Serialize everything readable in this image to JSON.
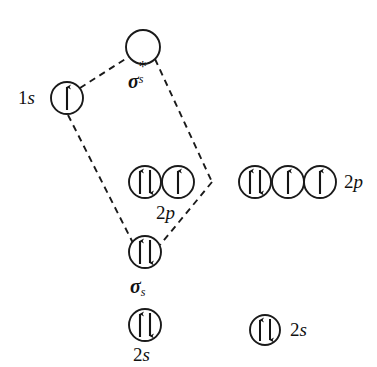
{
  "diagram": {
    "kind": "molecular-orbital-correlation-diagram",
    "background_color": "#ffffff",
    "stroke_color": "#1a1a1a",
    "text_color": "#111111",
    "width": 377,
    "height": 367
  },
  "labels": {
    "one_s": "1s",
    "sigma_s_star_symbol": "σ",
    "sigma_s_star_sub": "s",
    "sigma_s_star_sup": "*",
    "sigma_s_symbol": "σ",
    "sigma_s_sub": "s",
    "two_p_center": "2p",
    "two_p_right": "2p",
    "two_s_center": "2s",
    "two_s_right": "2s"
  },
  "orbitals": [
    {
      "id": "sigma-s-star",
      "label": "sigma-s-antibonding",
      "cx": 143,
      "cy": 47,
      "r": 17,
      "electrons": "none",
      "occupancy": 0
    },
    {
      "id": "atom-left-1s",
      "label": "1s",
      "cx": 67,
      "cy": 98,
      "r": 16,
      "electrons": "single-up",
      "occupancy": 1
    },
    {
      "id": "center-2p-a",
      "label": "2p",
      "cx": 145,
      "cy": 182,
      "r": 16,
      "electrons": "paired",
      "occupancy": 2
    },
    {
      "id": "center-2p-b",
      "label": "2p",
      "cx": 178,
      "cy": 182,
      "r": 16,
      "electrons": "single-up",
      "occupancy": 1
    },
    {
      "id": "right-2p-a",
      "label": "2p",
      "cx": 255,
      "cy": 182,
      "r": 16,
      "electrons": "paired",
      "occupancy": 2
    },
    {
      "id": "right-2p-b",
      "label": "2p",
      "cx": 288,
      "cy": 182,
      "r": 16,
      "electrons": "single-up",
      "occupancy": 1
    },
    {
      "id": "right-2p-c",
      "label": "2p",
      "cx": 320,
      "cy": 182,
      "r": 16,
      "electrons": "single-up",
      "occupancy": 1
    },
    {
      "id": "sigma-s",
      "label": "sigma-s-bonding",
      "cx": 145,
      "cy": 252,
      "r": 16,
      "electrons": "paired",
      "occupancy": 2
    },
    {
      "id": "center-2s",
      "label": "2s",
      "cx": 145,
      "cy": 325,
      "r": 16,
      "electrons": "paired",
      "occupancy": 2
    },
    {
      "id": "right-2s",
      "label": "2s",
      "cx": 265,
      "cy": 330,
      "r": 15,
      "electrons": "paired",
      "occupancy": 2
    }
  ],
  "correlation_lines": [
    {
      "id": "line-1s-to-sigma-star",
      "from": "atom-left-1s",
      "to": "sigma-s-star",
      "style": "dashed"
    },
    {
      "id": "line-sigma-star-to-vertex",
      "from": "sigma-s-star",
      "to": "right-vertex",
      "style": "dashed"
    },
    {
      "id": "line-vertex-to-sigma",
      "from": "right-vertex",
      "to": "sigma-s",
      "style": "dashed"
    },
    {
      "id": "line-1s-to-sigma",
      "from": "atom-left-1s",
      "to": "sigma-s",
      "style": "dashed"
    }
  ]
}
